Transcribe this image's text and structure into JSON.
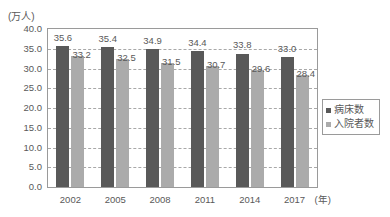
{
  "chart_data": {
    "type": "bar",
    "title": "",
    "subtitle": "",
    "xlabel": "年",
    "ylabel": "",
    "unit_label": "(万人)",
    "categories": [
      "2002",
      "2005",
      "2008",
      "2011",
      "2014",
      "2017"
    ],
    "series": [
      {
        "name": "病床数",
        "color": "#595959",
        "values": [
          35.6,
          35.4,
          34.9,
          34.4,
          33.8,
          33.0
        ],
        "labels": [
          "35.6",
          "35.4",
          "34.9",
          "34.4",
          "33.8",
          "33.0"
        ]
      },
      {
        "name": "入院者数",
        "color": "#ababab",
        "values": [
          33.2,
          32.5,
          31.5,
          30.7,
          29.6,
          28.4
        ],
        "labels": [
          "33.2",
          "32.5",
          "31.5",
          "30.7",
          "29.6",
          "28.4"
        ]
      }
    ],
    "ylim": [
      0.0,
      40.0
    ],
    "ytick_step": 5.0,
    "ytick_labels": [
      "40.0",
      "35.0",
      "30.0",
      "25.0",
      "20.0",
      "15.0",
      "10.0",
      "5.0",
      "0.0"
    ],
    "ytick_values": [
      40.0,
      35.0,
      30.0,
      25.0,
      20.0,
      15.0,
      10.0,
      5.0,
      0.0
    ],
    "xtick_labels": [
      "2002",
      "2005",
      "2008",
      "2011",
      "2014",
      "2017"
    ],
    "xaxis_unit_suffix": "(年)",
    "grid": true,
    "grid_style": "dashed",
    "grid_color": "#a8a8a8",
    "legend_position": "right",
    "legend_entries": [
      "病床数",
      "入院者数"
    ],
    "frame_color": "#9a9a9a",
    "background": "#ffffff",
    "text_color": "#595959"
  }
}
